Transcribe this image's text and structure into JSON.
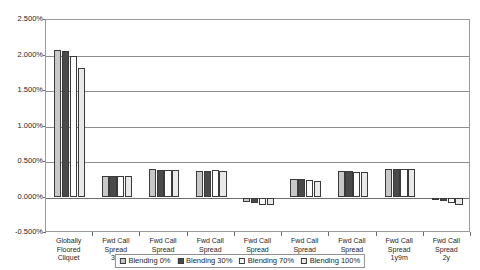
{
  "title": {
    "text": "Comparison of prices across blending levels for structured products",
    "cut_off": true
  },
  "chart_data": {
    "type": "bar",
    "title": "",
    "xlabel": "",
    "ylabel": "",
    "ylim": [
      -0.005,
      0.025
    ],
    "y_tick_labels": [
      "2.500%",
      "2.000%",
      "1.500%",
      "1.000%",
      "0.500%",
      "0.000%",
      "-0.500%"
    ],
    "y_tick_values": [
      0.025,
      0.02,
      0.015,
      0.01,
      0.005,
      0.0,
      -0.005
    ],
    "grid": true,
    "grid_axis": "y",
    "legend_position": "bottom",
    "categories": [
      "Globally Floored Cliquet",
      "Fwd Call Spread 3m",
      "Fwd Call Spread 6m",
      "Fwd Call Spread 9m",
      "Fwd Call Spread 1y",
      "Fwd Call Spread 1y3m",
      "Fwd Call Spread 1y6m",
      "Fwd Call Spread 1y9m",
      "Fwd Call Spread 2y"
    ],
    "category_lines": [
      [
        "Globally",
        "Floored",
        "Cliquet"
      ],
      [
        "Fwd Call",
        "Spread",
        "3m"
      ],
      [
        "Fwd Call",
        "Spread",
        "6m"
      ],
      [
        "Fwd Call",
        "Spread",
        "9m"
      ],
      [
        "Fwd Call",
        "Spread",
        "1y"
      ],
      [
        "Fwd Call",
        "Spread",
        "1y3m"
      ],
      [
        "Fwd Call",
        "Spread",
        "1y6m"
      ],
      [
        "Fwd Call",
        "Spread",
        "1y9m"
      ],
      [
        "Fwd Call",
        "Spread",
        "2y"
      ]
    ],
    "series": [
      {
        "name": "Blending 0%",
        "color": "#c8c8c8",
        "values": [
          0.0208,
          0.003,
          0.004,
          0.0038,
          -0.0007,
          0.0026,
          0.0037,
          0.004,
          -0.0003
        ]
      },
      {
        "name": "Blending 30%",
        "color": "#4a4a4a",
        "values": [
          0.0206,
          0.003,
          0.0039,
          0.0038,
          -0.0008,
          0.00255,
          0.00368,
          0.004,
          -0.0005
        ]
      },
      {
        "name": "Blending 70%",
        "color": "#fdfdfd",
        "values": [
          0.0199,
          0.003,
          0.00385,
          0.00385,
          -0.001,
          0.00245,
          0.00366,
          0.004,
          -0.0008
        ]
      },
      {
        "name": "Blending 100%",
        "color": "#e9e9e9",
        "values": [
          0.0182,
          0.003,
          0.00382,
          0.00368,
          -0.0011,
          0.00232,
          0.00358,
          0.004,
          -0.001
        ]
      }
    ]
  },
  "legend": {
    "items": [
      {
        "label": "Blending 0%",
        "color": "#c8c8c8"
      },
      {
        "label": "Blending 30%",
        "color": "#4a4a4a"
      },
      {
        "label": "Blending 70%",
        "color": "#fdfdfd"
      },
      {
        "label": "Blending 100%",
        "color": "#e9e9e9"
      }
    ]
  }
}
